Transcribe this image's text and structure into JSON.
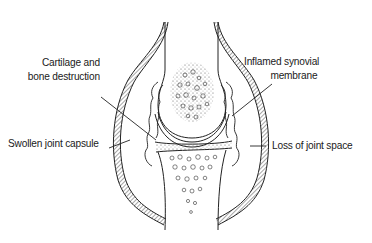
{
  "diagram": {
    "labels": {
      "cartilage_line1": "Cartilage and",
      "cartilage_line2": "bone destruction",
      "synovial_line1": "Inflamed synovial",
      "synovial_line2": "membrane",
      "capsule": "Swollen joint capsule",
      "joint_space": "Loss of  joint space"
    },
    "colors": {
      "ink": "#1a1a1a",
      "background": "#ffffff"
    }
  }
}
